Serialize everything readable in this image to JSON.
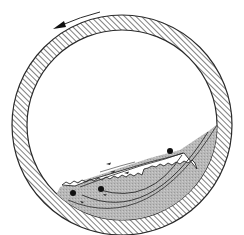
{
  "diagram": {
    "rotation_direction": "counter-clockwise",
    "colors": {
      "background": "#ffffff",
      "line": "#2a2a2a",
      "wall_hatch": "#3a3a3a",
      "bed_fill": "#b4b4b4",
      "bed_inner": "#c2c2c2",
      "particle": "#111111"
    },
    "drum": {
      "cx": 122,
      "cy": 125,
      "outer_r": 110,
      "inner_r": 95
    },
    "particles": [
      {
        "name": "tracer-particle-upper",
        "cx": 170,
        "cy": 151,
        "r": 3
      },
      {
        "name": "tracer-particle-middle",
        "cx": 101,
        "cy": 189,
        "r": 3
      },
      {
        "name": "tracer-particle-lower",
        "cx": 73,
        "cy": 193,
        "r": 3
      }
    ],
    "labels": []
  }
}
